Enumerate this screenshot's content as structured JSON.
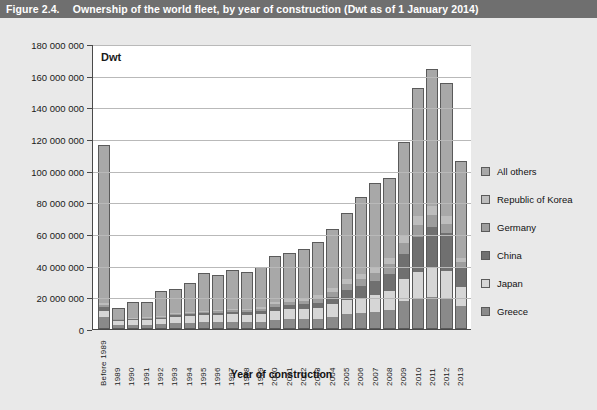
{
  "header": {
    "figure_number": "Figure 2.4.",
    "title": "Ownership of the world fleet, by year of construction (Dwt as of 1 January 2014)"
  },
  "chart_data": {
    "type": "bar",
    "stacked": true,
    "title": "Ownership of the world fleet, by year of construction (Dwt as of 1 January 2014)",
    "unit_label": "Dwt",
    "xlabel": "Year of construction",
    "ylabel": "",
    "ylim": [
      0,
      180000000
    ],
    "ytick_step": 20000000,
    "grid": true,
    "legend_position": "right",
    "ytick_labels": [
      "180 000 000",
      "160 000 000",
      "140 000 000",
      "120 000 000",
      "100 000 000",
      "80 000 000",
      "60 000 000",
      "40 000 000",
      "20 000 000",
      "0"
    ],
    "categories": [
      "Before 1989",
      "1989",
      "1990",
      "1991",
      "1992",
      "1993",
      "1994",
      "1995",
      "1996",
      "1997",
      "1998",
      "1999",
      "2000",
      "2001",
      "2002",
      "2003",
      "2004",
      "2005",
      "2006",
      "2007",
      "2008",
      "2009",
      "2010",
      "2011",
      "2012",
      "2013"
    ],
    "series": [
      {
        "name": "Greece",
        "color": "#8a8a8a",
        "values": [
          7000000,
          2000000,
          2200000,
          2200000,
          2400000,
          3200000,
          3400000,
          3800000,
          3600000,
          3800000,
          3600000,
          4000000,
          5000000,
          5600000,
          5400000,
          5600000,
          6800000,
          8600000,
          9200000,
          10000000,
          11600000,
          17000000,
          18600000,
          19600000,
          18400000,
          14000000
        ]
      },
      {
        "name": "Japan",
        "color": "#d6d6d6",
        "values": [
          4000000,
          2400000,
          2600000,
          3000000,
          3400000,
          4000000,
          4200000,
          4400000,
          4600000,
          4800000,
          4600000,
          5000000,
          6000000,
          6400000,
          6600000,
          7000000,
          8200000,
          9200000,
          9800000,
          10600000,
          11600000,
          14000000,
          17000000,
          18400000,
          17600000,
          12000000
        ]
      },
      {
        "name": "China",
        "color": "#707070",
        "values": [
          2400000,
          600000,
          700000,
          700000,
          800000,
          900000,
          1000000,
          1200000,
          1400000,
          1600000,
          1800000,
          2000000,
          2400000,
          2600000,
          3000000,
          3400000,
          4400000,
          6000000,
          7400000,
          9000000,
          11000000,
          16000000,
          22000000,
          26000000,
          24000000,
          12000000
        ]
      },
      {
        "name": "Germany",
        "color": "#9d9d9d",
        "values": [
          1200000,
          400000,
          400000,
          400000,
          500000,
          600000,
          700000,
          800000,
          900000,
          1000000,
          1100000,
          1300000,
          1600000,
          1900000,
          2200000,
          2600000,
          3200000,
          4000000,
          4600000,
          5200000,
          6000000,
          7000000,
          7600000,
          7400000,
          6000000,
          3400000
        ]
      },
      {
        "name": "Republic of Korea",
        "color": "#bdbdbd",
        "values": [
          1400000,
          400000,
          400000,
          500000,
          500000,
          600000,
          700000,
          800000,
          900000,
          1000000,
          1100000,
          1200000,
          1500000,
          1700000,
          1900000,
          2200000,
          2600000,
          3000000,
          3400000,
          3800000,
          4200000,
          5000000,
          5400000,
          5400000,
          4600000,
          2600000
        ]
      },
      {
        "name": "All others",
        "color": "#a8a8a8",
        "values": [
          99000000,
          6200000,
          9700000,
          9200000,
          15400000,
          14700000,
          18000000,
          23000000,
          21600000,
          23800000,
          22800000,
          24500000,
          28500000,
          28800000,
          29900000,
          33200000,
          36800000,
          41200000,
          47600000,
          52400000,
          49600000,
          58000000,
          80400000,
          86200000,
          83400000,
          61000000
        ]
      }
    ]
  },
  "legend": {
    "items": [
      {
        "label": "All others",
        "color": "#a8a8a8"
      },
      {
        "label": "Republic of Korea",
        "color": "#bdbdbd"
      },
      {
        "label": "Germany",
        "color": "#9d9d9d"
      },
      {
        "label": "China",
        "color": "#707070"
      },
      {
        "label": "Japan",
        "color": "#d6d6d6"
      },
      {
        "label": "Greece",
        "color": "#8a8a8a"
      }
    ]
  }
}
